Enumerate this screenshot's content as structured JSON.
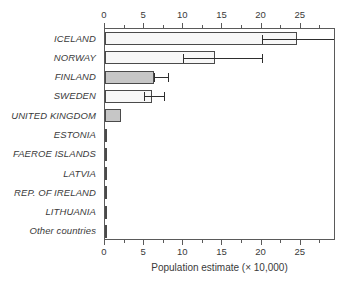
{
  "chart_data": {
    "type": "bar",
    "orientation": "horizontal",
    "title": "",
    "subtitle": "",
    "xlabel": "Population estimate (× 10,000)",
    "ylabel": "",
    "xlim": [
      0,
      29.5
    ],
    "xticks": [
      0,
      5,
      10,
      15,
      20,
      25
    ],
    "xticklabels": [
      "0",
      "5",
      "10",
      "15",
      "20",
      "25"
    ],
    "minor_tick_step": 2.5,
    "grid": false,
    "legend": null,
    "axis_top": true,
    "axis_bottom": true,
    "categories": [
      "ICELAND",
      "NORWAY",
      "FINLAND",
      "SWEDEN",
      "UNITED KINGDOM",
      "ESTONIA",
      "FAEROE ISLANDS",
      "LATVIA",
      "REP. OF IRELAND",
      "LITHUANIA",
      "Other countries"
    ],
    "values": [
      24.5,
      14.0,
      6.3,
      6.0,
      2.0,
      0.2,
      0.05,
      0.05,
      0.05,
      0.05,
      0.05
    ],
    "fills": [
      "white",
      "white",
      "gray",
      "white",
      "gray",
      "gray",
      "gray",
      "gray",
      "gray",
      "gray",
      "gray"
    ],
    "error_bars": [
      {
        "low": 20.0,
        "high": 29.5,
        "clipped_high": true
      },
      {
        "low": 10.0,
        "high": 20.0,
        "clipped_high": false
      },
      {
        "low": 6.3,
        "high": 8.0,
        "clipped_high": false
      },
      {
        "low": 5.0,
        "high": 7.5,
        "clipped_high": false
      },
      null,
      null,
      null,
      null,
      null,
      null,
      null
    ]
  },
  "colors": {
    "bar_white": "#f7f7f7",
    "bar_gray": "#c6c6c6",
    "bar_edge": "#4a4a4a",
    "axis": "#5a5a5a",
    "error": "#2e2e2e",
    "text": "#3a3a3a",
    "background": "#ffffff"
  }
}
